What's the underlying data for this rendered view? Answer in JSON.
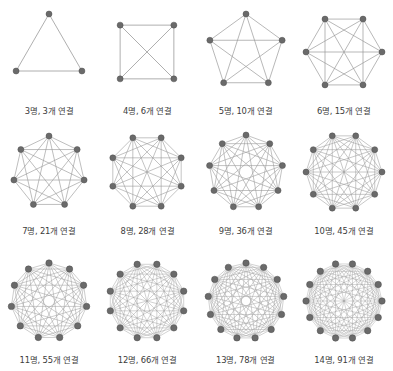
{
  "figure": {
    "title": "",
    "background_color": "#ffffff",
    "node_color": "#6a6a6a",
    "node_stroke_color": "#4f4f4f",
    "edge_color": "#9a9a9a",
    "caption_color": "#3c3c3c",
    "columns": 4,
    "rows": 3
  },
  "chart_data": {
    "type": "diagram",
    "subtype": "complete-graph-series",
    "title": "",
    "xlabel": "",
    "ylabel": "",
    "categories": [
      "3명",
      "4명",
      "5명",
      "6명",
      "7명",
      "8명",
      "9명",
      "10명",
      "11명",
      "12명",
      "13명",
      "14명"
    ],
    "values": [
      3,
      6,
      10,
      15,
      21,
      28,
      36,
      45,
      55,
      66,
      78,
      91
    ],
    "series": [
      {
        "name": "연결 수",
        "values": [
          3,
          6,
          10,
          15,
          21,
          28,
          36,
          45,
          55,
          66,
          78,
          91
        ]
      },
      {
        "name": "노드 수",
        "values": [
          3,
          4,
          5,
          6,
          7,
          8,
          9,
          10,
          11,
          12,
          13,
          14
        ]
      }
    ]
  },
  "graphs": [
    {
      "nodes": 3,
      "edges": 3,
      "caption": "3명, 3개 연결",
      "radius": 38,
      "node_r": 3.0,
      "edge_w": 0.8
    },
    {
      "nodes": 4,
      "edges": 6,
      "caption": "4명, 6개 연결",
      "radius": 38,
      "node_r": 3.0,
      "edge_w": 0.8,
      "rotate": 45
    },
    {
      "nodes": 5,
      "edges": 10,
      "caption": "5명, 10개 연결",
      "radius": 38,
      "node_r": 3.0,
      "edge_w": 0.7
    },
    {
      "nodes": 6,
      "edges": 15,
      "caption": "6명, 15개 연결",
      "radius": 38,
      "node_r": 3.0,
      "edge_w": 0.7,
      "rotate": 30
    },
    {
      "nodes": 7,
      "edges": 21,
      "caption": "7명, 21개 연결",
      "radius": 36,
      "node_r": 3.0,
      "edge_w": 0.65
    },
    {
      "nodes": 8,
      "edges": 28,
      "caption": "8명, 28개 연결",
      "radius": 37,
      "node_r": 3.0,
      "edge_w": 0.6,
      "rotate": 22.5
    },
    {
      "nodes": 9,
      "edges": 36,
      "caption": "9명, 36개 연결",
      "radius": 37,
      "node_r": 3.0,
      "edge_w": 0.6
    },
    {
      "nodes": 10,
      "edges": 45,
      "caption": "10명, 45개 연결",
      "radius": 38,
      "node_r": 3.0,
      "edge_w": 0.55,
      "rotate": 18
    },
    {
      "nodes": 11,
      "edges": 55,
      "caption": "11명, 55개 연결",
      "radius": 38,
      "node_r": 3.2,
      "edge_w": 0.5
    },
    {
      "nodes": 12,
      "edges": 66,
      "caption": "12명, 66개 연결",
      "radius": 38,
      "node_r": 3.2,
      "edge_w": 0.45,
      "rotate": 15
    },
    {
      "nodes": 13,
      "edges": 78,
      "caption": "13명, 78개 연결",
      "radius": 38,
      "node_r": 3.2,
      "edge_w": 0.45
    },
    {
      "nodes": 14,
      "edges": 91,
      "caption": "14명, 91개 연결",
      "radius": 38,
      "node_r": 3.2,
      "edge_w": 0.4,
      "rotate": 12.85
    }
  ]
}
